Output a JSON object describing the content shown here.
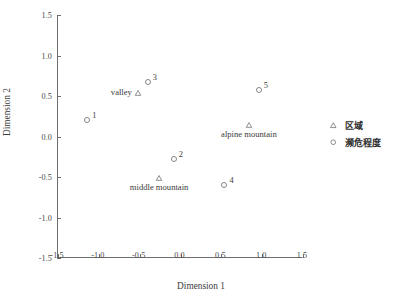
{
  "chart_data": {
    "type": "scatter",
    "title": "",
    "xlabel": "Dimension 1",
    "ylabel": "Dimension 2",
    "xlim": [
      -1.5,
      1.5
    ],
    "ylim": [
      -1.5,
      1.5
    ],
    "xticks": [
      "-1.5",
      "-1.0",
      "-0.5",
      "0.0",
      "0.5",
      "1.0",
      "1.5"
    ],
    "xtick_values": [
      -1.5,
      -1.0,
      -0.5,
      0.0,
      0.5,
      1.0,
      1.5
    ],
    "yticks": [
      "1.5",
      "1.0",
      "0.5",
      "0.0",
      "-0.5",
      "-1.0",
      "-1.5"
    ],
    "ytick_values": [
      1.5,
      1.0,
      0.5,
      0.0,
      -0.5,
      -1.0,
      -1.5
    ],
    "grid": false,
    "legend_position": "right",
    "series": [
      {
        "name": "区域",
        "marker": "triangle",
        "points": [
          {
            "label": "valley",
            "x": -0.51,
            "y": 0.54,
            "label_position": "left"
          },
          {
            "label": "middle mountain",
            "x": -0.25,
            "y": -0.51,
            "label_position": "below"
          },
          {
            "label": "alpine mountain",
            "x": 0.85,
            "y": 0.14,
            "label_position": "below"
          }
        ]
      },
      {
        "name": "濒危程度",
        "marker": "circle",
        "points": [
          {
            "label": "1",
            "x": -1.13,
            "y": 0.2,
            "label_position": "upper-right"
          },
          {
            "label": "2",
            "x": -0.07,
            "y": -0.28,
            "label_position": "upper-right"
          },
          {
            "label": "3",
            "x": -0.39,
            "y": 0.67,
            "label_position": "upper-right"
          },
          {
            "label": "4",
            "x": 0.55,
            "y": -0.6,
            "label_position": "upper-right"
          },
          {
            "label": "5",
            "x": 0.97,
            "y": 0.58,
            "label_position": "upper-right"
          }
        ]
      }
    ]
  },
  "legend": {
    "items": [
      {
        "label": "区域",
        "marker": "triangle"
      },
      {
        "label": "濒危程度",
        "marker": "circle"
      }
    ]
  },
  "colors": {
    "axis": "#6e6e6e",
    "text": "#3b3b3b",
    "marker": "#555555",
    "background": "#ffffff"
  }
}
